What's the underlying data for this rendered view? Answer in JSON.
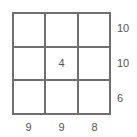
{
  "puzzle": {
    "grid": [
      [
        "",
        "",
        ""
      ],
      [
        "",
        "4",
        ""
      ],
      [
        "",
        "",
        ""
      ]
    ],
    "row_clues": [
      "10",
      "10",
      "6"
    ],
    "col_clues": [
      "9",
      "9",
      "8"
    ]
  }
}
